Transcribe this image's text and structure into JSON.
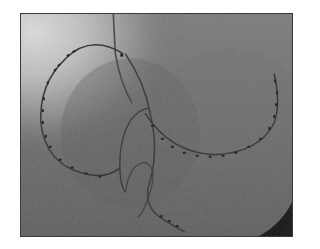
{
  "image": {
    "kind": "fluoroscopy",
    "description": "Grayscale fluoroscopic X-ray showing a circular multi-electrode catheter loop on the left, a larger curved electrode catheter on the right, and a guiding sheath/catheter looping downward in the center.",
    "colors": {
      "background": "#6e6e6e",
      "bright_region": "#d8d8d8",
      "catheter": "#3b3b3b",
      "electrode": "#2a2a2a",
      "dark_corner": "#111111",
      "frame_border": "#3a3a3a",
      "page": "#ffffff"
    }
  }
}
